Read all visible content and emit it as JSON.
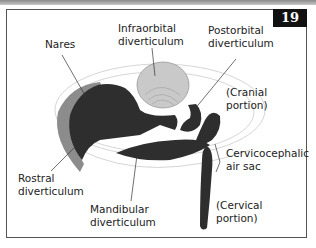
{
  "figure": {
    "number": "19",
    "labels": {
      "nares": "Nares",
      "infraorbital": "Infraorbital\ndiverticulum",
      "postorbital": "Postorbital\ndiverticulum",
      "cranial": "(Cranial\nportion)",
      "cervicocephalic": "Cervicocephalic\nair sac",
      "rostral": "Rostral\ndiverticulum",
      "mandibular": "Mandibular\ndiverticulum",
      "cervical": "(Cervical\nportion)"
    }
  },
  "colors": {
    "airsac_dark": "#2e2e2e",
    "rostral_rim": "#8c8c8c",
    "infraorbital_fill": "#c9c9c9",
    "skull_outline": "#d8d8d8",
    "badge_bg": "#111111"
  }
}
